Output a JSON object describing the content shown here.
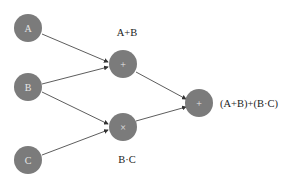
{
  "diagram": {
    "type": "computation-graph",
    "node_color": "#7b7b7b",
    "edge_color": "#333333",
    "nodes": [
      {
        "id": "A",
        "label": "A",
        "x": 28,
        "y": 28
      },
      {
        "id": "B",
        "label": "B",
        "x": 28,
        "y": 87
      },
      {
        "id": "C",
        "label": "C",
        "x": 28,
        "y": 160
      },
      {
        "id": "add1",
        "label": "+",
        "x": 123,
        "y": 64
      },
      {
        "id": "mul",
        "label": "×",
        "x": 123,
        "y": 127
      },
      {
        "id": "add2",
        "label": "+",
        "x": 199,
        "y": 103
      }
    ],
    "edges": [
      {
        "from": "A",
        "to": "add1"
      },
      {
        "from": "B",
        "to": "add1"
      },
      {
        "from": "B",
        "to": "mul"
      },
      {
        "from": "C",
        "to": "mul"
      },
      {
        "from": "add1",
        "to": "add2"
      },
      {
        "from": "mul",
        "to": "add2"
      }
    ],
    "labels": {
      "add1": "A+B",
      "mul": "B·C",
      "add2": "(A+B)+(B·C)"
    }
  }
}
